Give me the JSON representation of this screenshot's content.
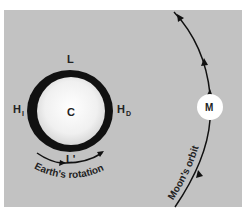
{
  "diagram": {
    "earth": {
      "center_label": "C",
      "top_label": "L",
      "bottom_label": "L'",
      "left_label_main": "H",
      "left_label_sub": "I",
      "right_label_main": "H",
      "right_label_sub": "D"
    },
    "moon": {
      "label": "M"
    },
    "rotation_label": "Earth's rotation",
    "orbit_label": "Moon's orbit"
  },
  "colors": {
    "background": "#c2c2c2",
    "earth_ring": "#111111",
    "earth_fill": "#f4f4f4",
    "moon_fill": "#ffffff",
    "lines": "#111111"
  }
}
